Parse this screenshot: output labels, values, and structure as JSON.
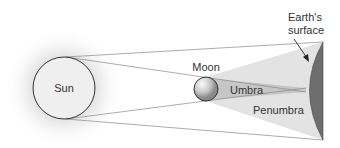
{
  "diagram": {
    "type": "solar-eclipse-geometry",
    "labels": {
      "sun": "Sun",
      "moon": "Moon",
      "umbra": "Umbra",
      "penumbra": "Penumbra",
      "earth_line1": "Earth's",
      "earth_line2": "surface"
    },
    "colors": {
      "sun_glow": "#d9d9d9",
      "sun_fill": "#ececec",
      "outline": "#333333",
      "rays": "#7a7a7a",
      "penumbra": "#e2e2e2",
      "umbra": "#c4c4c4",
      "earth": "#6e6e6e",
      "moon_light": "#f5f5f5",
      "moon_dark": "#8c8c8c"
    }
  }
}
